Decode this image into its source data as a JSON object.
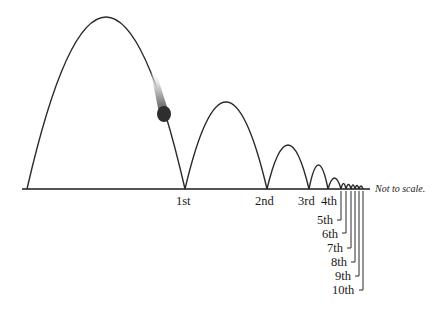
{
  "diagram": {
    "note": "Not to scale.",
    "baseline": {
      "x1": 22,
      "x2": 370,
      "y": 189
    },
    "arcs": [
      {
        "x1": 27,
        "x2": 185,
        "peak_y": 17
      },
      {
        "x1": 185,
        "x2": 267,
        "peak_y": 102
      },
      {
        "x1": 267,
        "x2": 309,
        "peak_y": 145
      },
      {
        "x1": 309,
        "x2": 328,
        "peak_y": 165
      },
      {
        "x1": 328,
        "x2": 341,
        "peak_y": 178
      },
      {
        "x1": 341,
        "x2": 346,
        "peak_y": 183
      },
      {
        "x1": 346,
        "x2": 351,
        "peak_y": 184
      },
      {
        "x1": 351,
        "x2": 355,
        "peak_y": 185
      },
      {
        "x1": 355,
        "x2": 359,
        "peak_y": 185.5
      },
      {
        "x1": 359,
        "x2": 363,
        "peak_y": 186
      }
    ],
    "bounces": [
      {
        "label": "1st"
      },
      {
        "label": "2nd"
      },
      {
        "label": "3rd"
      },
      {
        "label": "4th"
      },
      {
        "label": "5th"
      },
      {
        "label": "6th"
      },
      {
        "label": "7th"
      },
      {
        "label": "8th"
      },
      {
        "label": "9th"
      },
      {
        "label": "10th"
      }
    ],
    "ball": {
      "color": "#222222",
      "trail": "gradient"
    }
  }
}
